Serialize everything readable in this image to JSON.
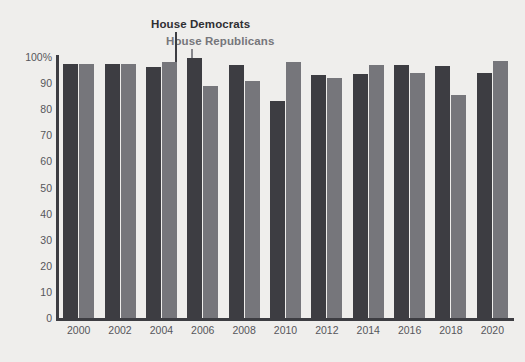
{
  "chart_data": {
    "type": "bar",
    "title": "",
    "subtitle": "",
    "xlabel": "",
    "ylabel": "",
    "ylim": [
      0,
      100
    ],
    "yticks": [
      "0",
      "10",
      "20",
      "30",
      "40",
      "50",
      "60",
      "70",
      "80",
      "90",
      "100%"
    ],
    "ytick_values": [
      0,
      10,
      20,
      30,
      40,
      50,
      60,
      70,
      80,
      90,
      100
    ],
    "grid": false,
    "legend_position": "top-center-annotation",
    "categories": [
      "2000",
      "2002",
      "2004",
      "2006",
      "2008",
      "2010",
      "2012",
      "2014",
      "2016",
      "2018",
      "2020"
    ],
    "series": [
      {
        "name": "House Democrats",
        "color": "#3d3d42",
        "values": [
          97.5,
          97.5,
          96,
          99.5,
          97,
          83,
          93,
          93.5,
          97,
          96.5,
          94
        ]
      },
      {
        "name": "House Republicans",
        "color": "#76767b",
        "values": [
          97.5,
          97.5,
          98,
          89,
          91,
          98,
          92,
          97,
          94,
          85.5,
          98.5
        ]
      }
    ],
    "annotations": [
      {
        "text": "House Democrats",
        "target_category": "2004",
        "target_series": "House Democrats"
      },
      {
        "text": "House Republicans",
        "target_category": "2004",
        "target_series": "House Republicans"
      }
    ]
  },
  "colors": {
    "background": "#efeeec",
    "axis": "#3d3d42",
    "tick_text": "#56565b",
    "democrat": "#3d3d42",
    "republican": "#76767b"
  }
}
